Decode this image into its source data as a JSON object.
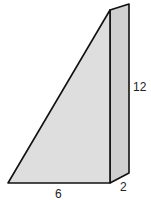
{
  "figure": {
    "type": "triangular-prism",
    "labels": {
      "base": "6",
      "depth": "2",
      "height": "12"
    },
    "colors": {
      "face_fill": "#dedede",
      "side_fill": "#d0d0d0",
      "stroke": "#111111"
    }
  }
}
